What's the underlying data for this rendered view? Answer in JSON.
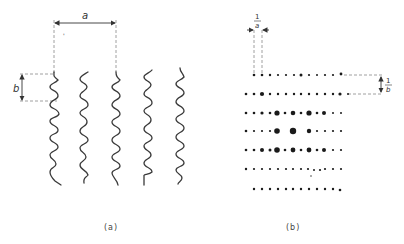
{
  "figure": {
    "panel_a": {
      "caption": "(a)",
      "dimension_horizontal_label": "a",
      "dimension_vertical_label": "b",
      "chain_count": 5,
      "description": "Five parallel wavy helical chains in real space"
    },
    "panel_b": {
      "caption": "(b)",
      "dimension_horizontal_label_num": "1",
      "dimension_horizontal_label_den": "a",
      "dimension_vertical_label_num": "1",
      "dimension_vertical_label_den": "b",
      "row_count": 7,
      "description": "Diffraction pattern: rows of spots with spacing 1/a and layer lines 1/b"
    },
    "colors": {
      "ink": "#3a3a3a",
      "dashed": "#8a8a8a",
      "background": "#ffffff"
    }
  }
}
